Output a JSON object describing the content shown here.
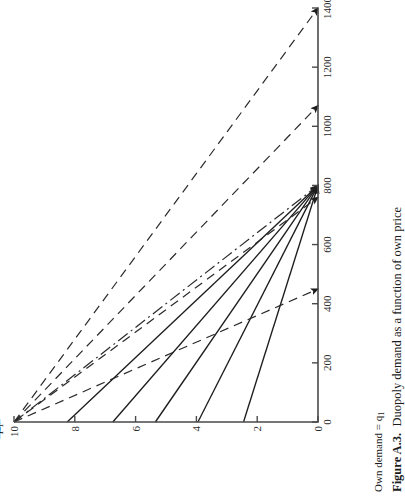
{
  "figure": {
    "caption_label": "Figure A.3.",
    "caption_text": "Duopoly demand as a function of own price",
    "axis_title": "Own demand = q",
    "axis_title_sub": "1",
    "orientation": "rotated-90-ccw",
    "background": "#ffffff",
    "ink": "#1d1d1d"
  },
  "chart_data": {
    "type": "line",
    "title": "Duopoly demand as a function of own price",
    "xlabel": "Own demand = q1",
    "ylabel": "Own price = p1",
    "xlim": [
      0,
      1400
    ],
    "ylim": [
      0,
      10
    ],
    "grid": false,
    "legend": "inline-curve-labels",
    "x_ticks": [
      0,
      200,
      400,
      600,
      800,
      1000,
      1200,
      1400
    ],
    "x_ticklabels": [
      "0",
      "200",
      "400",
      "600",
      "800",
      "1000",
      "1200",
      "1400"
    ],
    "y_ticks": [
      0,
      2,
      4,
      6,
      8,
      10
    ],
    "y_ticklabels": [
      "0",
      "2",
      "4",
      "6",
      "8",
      "10"
    ],
    "convergence_points": [
      {
        "q1": 800,
        "p1": 0
      },
      {
        "q1": 0,
        "p1": 10
      }
    ],
    "series": [
      {
        "name": "p2 = 0",
        "label": "p",
        "label_sub": "2",
        "label_rest": " = 0",
        "style": "solid",
        "points": [
          [
            800,
            0
          ],
          [
            0,
            10
          ]
        ],
        "arrow_end": true,
        "label_pos": {
          "q1": 330,
          "p1": 5.55
        }
      },
      {
        "name": "p2 = 2",
        "label": "p",
        "label_sub": "2",
        "label_rest": " = 2",
        "style": "solid",
        "points": [
          [
            800,
            0
          ],
          [
            0,
            10
          ]
        ],
        "arrow_end": true,
        "label_pos": {
          "q1": 480,
          "p1": 4.35
        }
      },
      {
        "name": "p2 = 4",
        "label": "p",
        "label_sub": "2",
        "label_rest": " = 4",
        "style": "solid",
        "points": [
          [
            800,
            0
          ],
          [
            0,
            10
          ]
        ],
        "arrow_end": true,
        "label_pos": {
          "q1": 640,
          "p1": 3.25
        }
      },
      {
        "name": "p2 = 6",
        "label": "p",
        "label_sub": "2",
        "label_rest": " = 6",
        "style": "solid",
        "points": [
          [
            800,
            0
          ],
          [
            0,
            10
          ]
        ],
        "arrow_end": true,
        "label_pos": {
          "q1": 820,
          "p1": 2.3
        }
      },
      {
        "name": "p2 = 8",
        "label": "p",
        "label_sub": "2",
        "label_rest": "=8",
        "style": "solid",
        "points": [
          [
            800,
            0
          ],
          [
            0,
            10
          ]
        ],
        "arrow_end": true,
        "label_pos": {
          "q1": 1010,
          "p1": 1.25
        }
      },
      {
        "name": "q2 = 0",
        "label": "q",
        "label_sub": "2",
        "label_rest": " = 0",
        "style": "dashed",
        "points": [
          [
            0,
            10
          ],
          [
            1400,
            0
          ]
        ],
        "arrow_end": true,
        "label_pos": {
          "q1": 1130,
          "p1": 1.05
        }
      },
      {
        "name": "q2 = 400",
        "label": "q",
        "label_sub": "2",
        "label_rest": " = 400",
        "style": "dashed",
        "points": [
          [
            0,
            10
          ],
          [
            1400,
            0
          ]
        ],
        "arrow_end": true,
        "label_pos": {
          "q1": 790,
          "p1": 3.0
        }
      },
      {
        "name": "q2 = 800",
        "label": "q",
        "label_sub": "2",
        "label_rest": " = 800",
        "style": "dashed",
        "points": [
          [
            0,
            10
          ],
          [
            1400,
            0
          ]
        ],
        "arrow_end": true,
        "label_pos": {
          "q1": 570,
          "p1": 4.35
        }
      },
      {
        "name": "q2 = 1200",
        "label": "q",
        "label_sub": "2",
        "label_rest": " = 1200",
        "style": "dashed",
        "points": [
          [
            0,
            10
          ],
          [
            1400,
            0
          ]
        ],
        "arrow_end": true,
        "label_pos": {
          "q1": 350,
          "p1": 5.7
        }
      },
      {
        "name": "p2 = p1",
        "label": "p",
        "label_sub": "2",
        "label_rest": " = p",
        "label_rest_sub": "1",
        "style": "dashdot",
        "points": [
          [
            0,
            10
          ],
          [
            800,
            0
          ]
        ],
        "arrow_end": false,
        "label_pos": {
          "q1": 905,
          "p1": 3.05
        }
      }
    ]
  }
}
